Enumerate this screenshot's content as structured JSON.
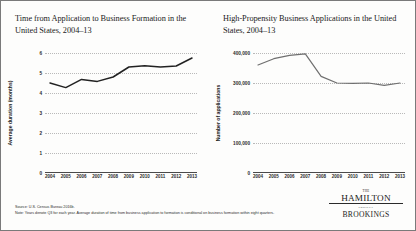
{
  "figure": {
    "source": "Source: U.S. Census Bureau 2016b.",
    "note": "Note: Years denote Q3 for each year. Average duration of time from business application to formation is conditional on business formation within eight quarters.",
    "logo": {
      "the": "THE",
      "hamilton": "HAMILTON",
      "project": "PROJECT",
      "brookings": "BROOKINGS"
    }
  },
  "chart_data": [
    {
      "type": "line",
      "panel": "left",
      "title": "Time from Application to Business Formation in the United States, 2004–13",
      "xlabel": "",
      "ylabel": "Average duration (months)",
      "categories": [
        "2004",
        "2005",
        "2006",
        "2007",
        "2008",
        "2009",
        "2010",
        "2011",
        "2012",
        "2013"
      ],
      "values": [
        4.5,
        4.27,
        4.68,
        4.58,
        4.8,
        5.3,
        5.36,
        5.3,
        5.35,
        5.75
      ],
      "yticks": [
        "0",
        "1",
        "2",
        "3",
        "4",
        "5",
        "6"
      ],
      "ytickvalues": [
        0,
        1,
        2,
        3,
        4,
        5,
        6
      ],
      "ylim": [
        0,
        6
      ],
      "grid": true,
      "legend": "none",
      "line_color": "#222222"
    },
    {
      "type": "line",
      "panel": "right",
      "title": "High-Propensity Business Applications in the United States, 2004–13",
      "xlabel": "",
      "ylabel": "Number of applications",
      "categories": [
        "2004",
        "2005",
        "2006",
        "2007",
        "2008",
        "2009",
        "2010",
        "2011",
        "2012",
        "2013"
      ],
      "values": [
        360000,
        381000,
        392000,
        397000,
        322000,
        300000,
        299000,
        300000,
        292000,
        300000
      ],
      "yticks": [
        "0",
        "100,000",
        "200,000",
        "300,000",
        "400,000"
      ],
      "ytickvalues": [
        0,
        100000,
        200000,
        300000,
        400000
      ],
      "ylim": [
        0,
        400000
      ],
      "grid": true,
      "legend": "none",
      "line_color": "#6f6f6f"
    }
  ]
}
